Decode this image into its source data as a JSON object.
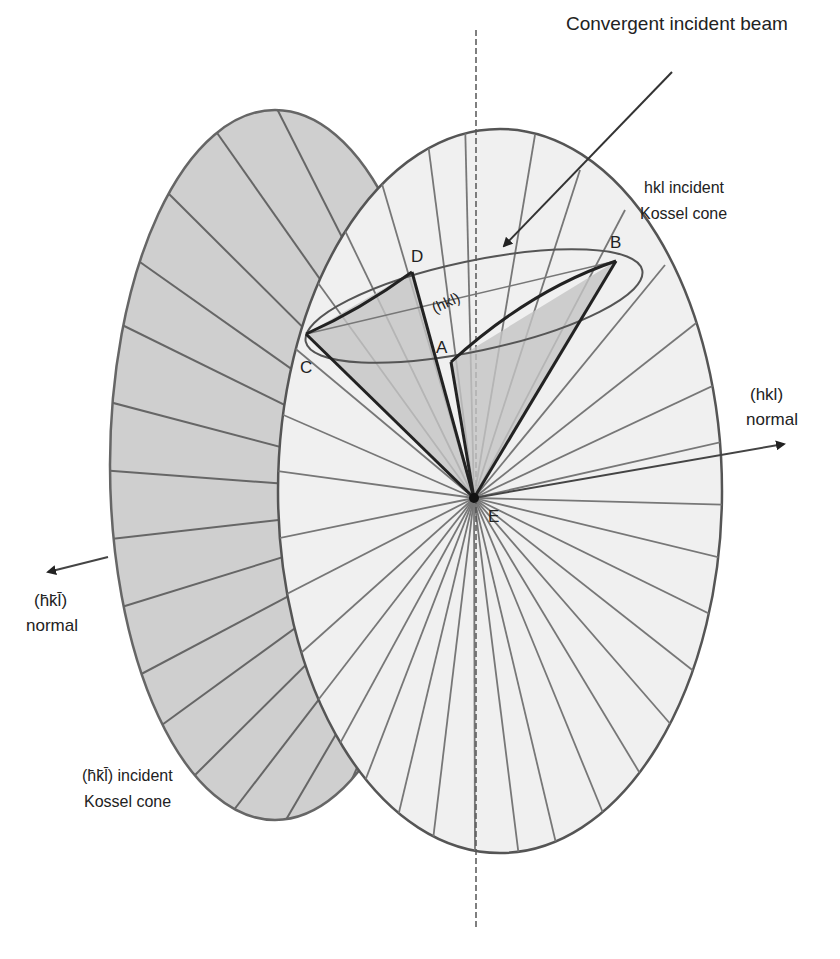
{
  "diagram": {
    "title_label": "Convergent incident beam",
    "hkl_cone_label": [
      "hkl incident",
      "Kossel cone"
    ],
    "hkl_normal_label": [
      "(hkl)",
      "normal"
    ],
    "bar_normal_label": [
      "(h̄k̄l̄)",
      "normal"
    ],
    "bar_cone_label": [
      "(h̄k̄l̄) incident",
      "Kossel cone"
    ],
    "plane_label": "(hkl)",
    "points": {
      "A": "A",
      "B": "B",
      "C": "C",
      "D": "D",
      "E": "E"
    },
    "colors": {
      "back_cone_fill": "#cfcfcf",
      "front_cone_fill": "#f0f0f0",
      "inner_cone_fill": "#c4c4c4",
      "stroke": "#555555",
      "dark_stroke": "#222222"
    }
  }
}
